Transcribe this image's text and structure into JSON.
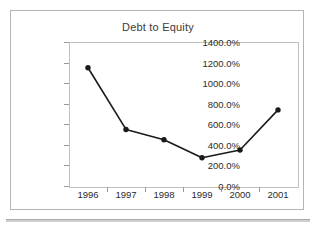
{
  "chart_data": {
    "type": "line",
    "title": "Debt to Equity",
    "xlabel": "",
    "ylabel": "",
    "categories": [
      "1996",
      "1997",
      "1998",
      "1999",
      "2000",
      "2001"
    ],
    "values": [
      1150,
      550,
      450,
      275,
      350,
      740
    ],
    "value_labels": [
      "1150.0%",
      "550.0%",
      "450.0%",
      "275.0%",
      "350.0%",
      "740.0%"
    ],
    "ylim": [
      0,
      1400
    ],
    "ytick_labels": [
      "1400.0%",
      "1200.0%",
      "1000.0%",
      "800.0%",
      "600.0%",
      "400.0%",
      "200.0%",
      "0.0%"
    ],
    "ytick_values": [
      1400,
      1200,
      1000,
      800,
      600,
      400,
      200,
      0
    ],
    "grid": false,
    "legend": false,
    "legend_position": "none",
    "series": [
      {
        "name": "Debt to Equity",
        "values": [
          1150,
          550,
          450,
          275,
          350,
          740
        ],
        "line_color": "#1a1a1a",
        "marker": "filled-circle",
        "marker_color": "#1a1a1a"
      }
    ],
    "colors": {
      "line": "#1a1a1a",
      "marker": "#1a1a1a",
      "axis": "#c0c0c0",
      "text": "#2b2b2b",
      "frame": "#b4b4b4",
      "background": "#ffffff"
    }
  }
}
